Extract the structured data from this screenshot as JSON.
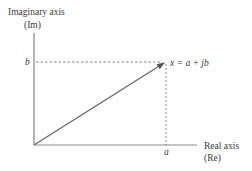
{
  "diagram": {
    "title_vertical_axis": "Imaginary axis",
    "vertical_axis_abbrev": "(Im)",
    "horizontal_axis": "Real axis",
    "horizontal_axis_abbrev": "(Re)",
    "point_label": "x = a + jb",
    "real_component_label": "a",
    "imaginary_component_label": "b",
    "colors": {
      "axis": "#6e6e6e",
      "vector": "#6a6a6a",
      "dashed": "#555555",
      "text": "#3a3a3a"
    }
  }
}
